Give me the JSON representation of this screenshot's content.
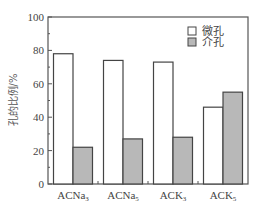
{
  "chart_data": {
    "type": "bar",
    "title": "",
    "xlabel": "",
    "ylabel": "孔的比例/%",
    "ylim": [
      0,
      100
    ],
    "yticks": [
      0,
      20,
      40,
      60,
      80,
      100
    ],
    "grid": false,
    "legend_position": "upper right",
    "categories": [
      {
        "base": "ACNa",
        "sub": "3"
      },
      {
        "base": "ACNa",
        "sub": "5"
      },
      {
        "base": "ACK",
        "sub": "3"
      },
      {
        "base": "ACK",
        "sub": "5"
      }
    ],
    "series": [
      {
        "name": "微孔",
        "color": "#ffffff",
        "values": [
          78,
          74,
          73,
          46
        ]
      },
      {
        "name": "介孔",
        "color": "#b8b8b8",
        "values": [
          22,
          27,
          28,
          55
        ]
      }
    ]
  },
  "style": {
    "axis_color": "#555555",
    "bar_edge": "#444444"
  }
}
